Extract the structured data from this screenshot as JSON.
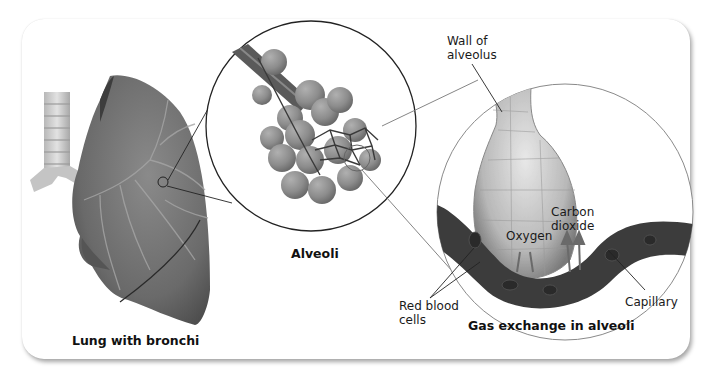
{
  "figure": {
    "panels": [
      {
        "id": "lung",
        "caption": "Lung with bronchi"
      },
      {
        "id": "alveoli",
        "caption": "Alveoli"
      },
      {
        "id": "gas_exchange",
        "caption": "Gas exchange in alveoli"
      }
    ],
    "labels": {
      "wall_of_alveolus_line1": "Wall of",
      "wall_of_alveolus_line2": "alveolus",
      "carbon_dioxide_line1": "Carbon",
      "carbon_dioxide_line2": "dioxide",
      "oxygen": "Oxygen",
      "red_blood_cells_line1": "Red blood",
      "red_blood_cells_line2": "cells",
      "capillary": "Capillary"
    },
    "colors": {
      "background": "#ffffff",
      "lung": "#6e6e6e",
      "lung_dark": "#4a4a4a",
      "alveoli": "#8a8a8a",
      "capillary": "#3a3a3a",
      "outline": "#222222"
    }
  }
}
